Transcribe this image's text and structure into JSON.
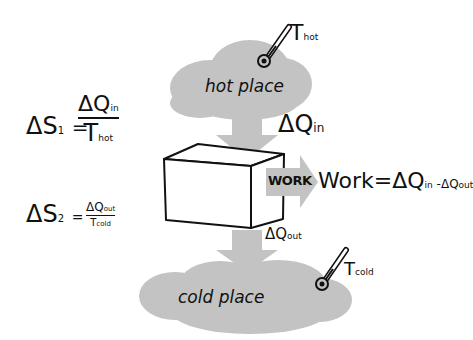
{
  "diagram": {
    "title": "",
    "colors": {
      "cloud": "#c3c3c3",
      "arrow": "#c3c3c3",
      "ink": "#111111",
      "background": "#ffffff"
    },
    "hot_reservoir": {
      "label": "hot place",
      "temperature_symbol": "T",
      "temperature_sub": "hot"
    },
    "cold_reservoir": {
      "label": "cold place",
      "temperature_symbol": "T",
      "temperature_sub": "cold"
    },
    "heat_in": {
      "symbol": "ΔQ",
      "sub": "in"
    },
    "heat_out": {
      "symbol": "ΔQ",
      "sub": "out"
    },
    "engine": {
      "shape": "cube",
      "work_arrow_label": "WORK"
    },
    "equations": {
      "work": {
        "lhs": "Work",
        "eq": "=",
        "term1": "ΔQ",
        "term1_sub": "in",
        "minus": "-",
        "term2": "ΔQ",
        "term2_sub": "out"
      },
      "entropy1": {
        "lhs": "ΔS",
        "lhs_sub": "1",
        "eq": "=",
        "num": "ΔQ",
        "num_sub": "in",
        "den": "T",
        "den_sub": "hot"
      },
      "entropy2": {
        "lhs": "ΔS",
        "lhs_sub": "2",
        "eq": "=",
        "num": "ΔQ",
        "num_sub": "out",
        "den": "T",
        "den_sub": "cold"
      }
    }
  }
}
